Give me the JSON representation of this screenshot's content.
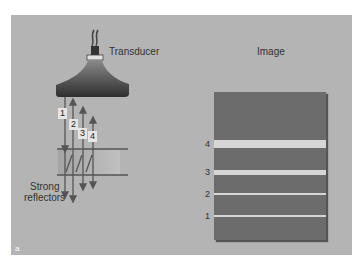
{
  "left_panel": {
    "title": "Transducer",
    "reflector_label_line1": "Strong",
    "reflector_label_line2": "reflectors",
    "echo_labels": [
      "1",
      "2",
      "3",
      "4"
    ]
  },
  "right_panel": {
    "title": "Image",
    "band_labels": [
      "4",
      "3",
      "2",
      "1"
    ]
  },
  "panel_letter": "a",
  "colors": {
    "panel_bg": "#b4b4b4",
    "image_bg": "#6c6c6c",
    "band": "#d6d6d6",
    "arrow": "#555555"
  }
}
